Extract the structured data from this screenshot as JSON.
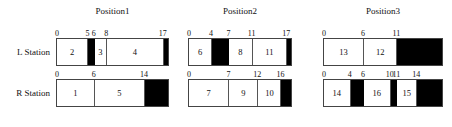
{
  "figure": {
    "row_labels": {
      "left": "L Station",
      "right": "R Station"
    }
  },
  "chart_data": {
    "type": "bar",
    "title": "",
    "xlabel": "",
    "ylabel": "",
    "orientation": "horizontal-timeline",
    "grid": false,
    "legend": "none",
    "note": "Gantt-style schedule: white segments are numbered jobs, black segments are idle/blocked intervals.",
    "groups": [
      {
        "title": "Position1",
        "rows": [
          {
            "label": "L Station",
            "axis_ticks": [
              0,
              5,
              6,
              8,
              17
            ],
            "axis_range": [
              0,
              18
            ],
            "segments": [
              {
                "label": "2",
                "start": 0,
                "end": 5,
                "fill": "white"
              },
              {
                "label": "",
                "start": 5,
                "end": 6,
                "fill": "black"
              },
              {
                "label": "3",
                "start": 6,
                "end": 8,
                "fill": "white"
              },
              {
                "label": "4",
                "start": 8,
                "end": 17,
                "fill": "white"
              },
              {
                "label": "",
                "start": 17,
                "end": 18,
                "fill": "black"
              }
            ]
          },
          {
            "label": "R Station",
            "axis_ticks": [
              0,
              6,
              14
            ],
            "axis_range": [
              0,
              18
            ],
            "segments": [
              {
                "label": "1",
                "start": 0,
                "end": 6,
                "fill": "white"
              },
              {
                "label": "5",
                "start": 6,
                "end": 14,
                "fill": "white"
              },
              {
                "label": "",
                "start": 14,
                "end": 18,
                "fill": "black"
              }
            ]
          }
        ]
      },
      {
        "title": "Position2",
        "rows": [
          {
            "label": "L Station",
            "axis_ticks": [
              0,
              4,
              7,
              11,
              17
            ],
            "axis_range": [
              0,
              18
            ],
            "segments": [
              {
                "label": "6",
                "start": 0,
                "end": 4,
                "fill": "white"
              },
              {
                "label": "",
                "start": 4,
                "end": 7,
                "fill": "black"
              },
              {
                "label": "8",
                "start": 7,
                "end": 11,
                "fill": "white"
              },
              {
                "label": "11",
                "start": 11,
                "end": 17,
                "fill": "white"
              },
              {
                "label": "",
                "start": 17,
                "end": 18,
                "fill": "black"
              }
            ]
          },
          {
            "label": "R Station",
            "axis_ticks": [
              0,
              7,
              12,
              16
            ],
            "axis_range": [
              0,
              18
            ],
            "segments": [
              {
                "label": "7",
                "start": 0,
                "end": 7,
                "fill": "white"
              },
              {
                "label": "9",
                "start": 7,
                "end": 12,
                "fill": "white"
              },
              {
                "label": "10",
                "start": 12,
                "end": 16,
                "fill": "white"
              },
              {
                "label": "",
                "start": 16,
                "end": 18,
                "fill": "black"
              }
            ]
          }
        ]
      },
      {
        "title": "Position3",
        "rows": [
          {
            "label": "L Station",
            "axis_ticks": [
              0,
              6,
              11
            ],
            "axis_range": [
              0,
              18
            ],
            "segments": [
              {
                "label": "13",
                "start": 0,
                "end": 6,
                "fill": "white"
              },
              {
                "label": "12",
                "start": 6,
                "end": 11,
                "fill": "white"
              },
              {
                "label": "",
                "start": 11,
                "end": 18,
                "fill": "black"
              }
            ]
          },
          {
            "label": "R Station",
            "axis_ticks": [
              0,
              4,
              6,
              10,
              11,
              14
            ],
            "axis_range": [
              0,
              18
            ],
            "segments": [
              {
                "label": "14",
                "start": 0,
                "end": 4,
                "fill": "white"
              },
              {
                "label": "",
                "start": 4,
                "end": 6,
                "fill": "black"
              },
              {
                "label": "16",
                "start": 6,
                "end": 10,
                "fill": "white"
              },
              {
                "label": "",
                "start": 10,
                "end": 11,
                "fill": "black"
              },
              {
                "label": "15",
                "start": 11,
                "end": 14,
                "fill": "white"
              },
              {
                "label": "",
                "start": 14,
                "end": 18,
                "fill": "black"
              }
            ]
          }
        ]
      }
    ]
  }
}
